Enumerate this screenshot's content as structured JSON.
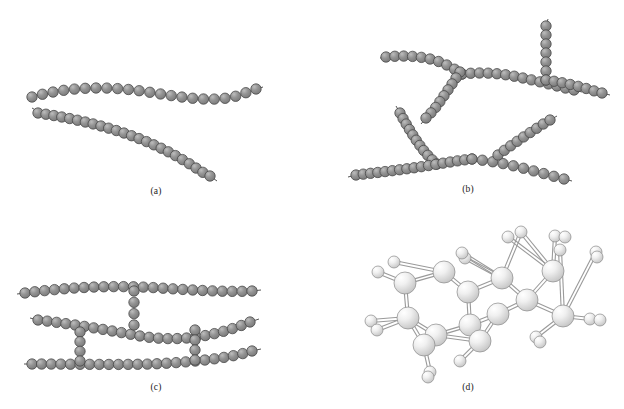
{
  "figure": {
    "background_color": "#ffffff",
    "layout": "2x2 grid of four polymer structure illustrations",
    "bead_color": "#8d8d8d",
    "bead_highlight_color": "#b9b9b9",
    "bead_outline_color": "#4a4a4a",
    "bond_color": "#555555",
    "atom_light_color": "#f2f2f2",
    "atom_shade_color": "#c9c9c9",
    "atom_outline_color": "#8a8a8a"
  },
  "panels": [
    {
      "id": "a",
      "caption": "(a)",
      "structure_type": "linear",
      "description": "Two separate unbranched bead chains",
      "chain_count": 2,
      "bead_radius": 5.2,
      "chains": [
        {
          "name": "upper-linear-chain",
          "bead_count": 22,
          "tail_start": [
            27,
            99
          ],
          "tail_end": [
            262,
            88
          ],
          "path": "M32,97 C70,86 110,86 148,92 C186,98 215,103 240,95 C248,92 252,90 256,89"
        },
        {
          "name": "lower-linear-chain",
          "bead_count": 24,
          "tail_start": [
            32,
            108
          ],
          "tail_end": [
            216,
            180
          ],
          "path": "M38,113 C72,118 106,126 135,137 C164,148 184,160 199,170 C204,173 207,175 210,176"
        }
      ]
    },
    {
      "id": "b",
      "caption": "(b)",
      "structure_type": "branched",
      "description": "Chains with side branches emanating from backbone junctions",
      "bead_radius": 5.2,
      "chains": [
        {
          "name": "upper-left-backbone",
          "bead_count": 10,
          "path": "M386,57 C404,55 424,56 440,62 C450,66 456,70 462,74"
        },
        {
          "name": "upper-right-backbone",
          "bead_count": 14,
          "path": "M462,74 C480,72 500,73 518,77 C538,81 556,86 574,90"
        },
        {
          "name": "branch-descending-left",
          "bead_count": 9,
          "path": "M460,72 C452,84 444,96 436,107 C432,112 429,115 426,118"
        },
        {
          "name": "vertical-branch-top",
          "bead_count": 7,
          "path": "M546,26 C546,40 546,54 546,68 C546,74 546,77 546,80"
        },
        {
          "name": "right-horizontal-from-junction",
          "bead_count": 8,
          "path": "M546,80 C560,82 574,85 588,89 C594,91 598,92 602,93"
        },
        {
          "name": "mid-left-diagonal-branch",
          "bead_count": 11,
          "path": "M400,113 C406,124 413,136 421,147 C427,155 432,160 437,164"
        },
        {
          "name": "lower-backbone",
          "bead_count": 17,
          "path": "M356,175 C382,172 408,169 432,165 C450,162 462,160 472,159"
        },
        {
          "name": "lower-right-continuation",
          "bead_count": 10,
          "path": "M472,159 C492,161 512,165 530,170 C546,174 556,177 564,179"
        },
        {
          "name": "upper-right-diagonal-branch",
          "bead_count": 9,
          "path": "M498,155 C510,146 522,138 534,130 C542,125 546,122 550,120"
        }
      ]
    },
    {
      "id": "c",
      "caption": "(c)",
      "structure_type": "crosslinked",
      "description": "Three parallel chains joined by short vertical crosslink bridges",
      "bead_radius": 5.2,
      "main_chain_count": 3,
      "crosslink_count": 3,
      "chains": [
        {
          "name": "top-chain",
          "bead_count": 24,
          "path": "M25,293 C70,287 115,285 160,288 C205,291 232,292 252,291"
        },
        {
          "name": "middle-chain",
          "bead_count": 24,
          "path": "M38,320 C72,324 108,330 140,336 C176,342 212,338 250,322"
        },
        {
          "name": "bottom-chain",
          "bead_count": 24,
          "path": "M32,364 C72,364 112,365 152,364 C196,362 230,358 252,351"
        }
      ],
      "crosslinks": [
        {
          "name": "crosslink-upper-center",
          "bead_count": 4,
          "path": "M134,291 C134,302 134,313 134,325"
        },
        {
          "name": "crosslink-left-lower",
          "bead_count": 4,
          "path": "M80,332 C80,343 80,352 80,361"
        },
        {
          "name": "crosslink-right-lower",
          "bead_count": 4,
          "path": "M195,330 C195,341 195,350 195,360"
        }
      ]
    },
    {
      "id": "d",
      "caption": "(d)",
      "structure_type": "network",
      "description": "Three-dimensional ball-and-stick network with fused rings and terminal atoms",
      "large_atom_radius": 11,
      "small_atom_radius": 6,
      "large_atom_count": 13,
      "small_atom_count": 14,
      "bond_style": "double-line stick"
    }
  ]
}
